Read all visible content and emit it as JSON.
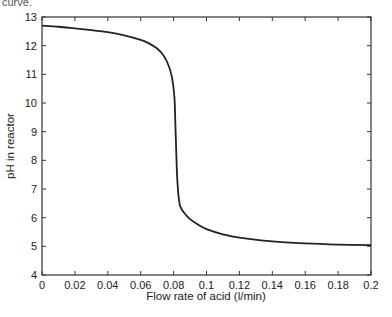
{
  "caption_fragment": "curve.",
  "chart_data": {
    "type": "line",
    "title": "",
    "xlabel": "Flow rate of acid (l/min)",
    "ylabel": "pH in reactor",
    "xlim": [
      0,
      0.2
    ],
    "ylim": [
      4,
      13
    ],
    "grid": false,
    "legend": null,
    "x_ticks": [
      "0",
      "0.02",
      "0.04",
      "0.06",
      "0.08",
      "0.1",
      "0.12",
      "0.14",
      "0.16",
      "0.18",
      "0.2"
    ],
    "y_ticks": [
      "4",
      "5",
      "6",
      "7",
      "8",
      "9",
      "10",
      "11",
      "12",
      "13"
    ],
    "series": [
      {
        "name": "pH titration curve",
        "color": "#222222",
        "x": [
          0,
          0.01,
          0.02,
          0.03,
          0.04,
          0.05,
          0.06,
          0.065,
          0.07,
          0.074,
          0.077,
          0.079,
          0.0805,
          0.081,
          0.0815,
          0.082,
          0.0825,
          0.083,
          0.0835,
          0.084,
          0.086,
          0.09,
          0.095,
          0.1,
          0.11,
          0.12,
          0.14,
          0.16,
          0.18,
          0.2
        ],
        "y": [
          12.7,
          12.66,
          12.6,
          12.54,
          12.47,
          12.36,
          12.2,
          12.08,
          11.9,
          11.65,
          11.3,
          10.9,
          10.2,
          9.4,
          8.5,
          7.6,
          7.1,
          6.75,
          6.55,
          6.4,
          6.2,
          5.95,
          5.75,
          5.6,
          5.42,
          5.3,
          5.17,
          5.1,
          5.06,
          5.04
        ]
      }
    ]
  }
}
